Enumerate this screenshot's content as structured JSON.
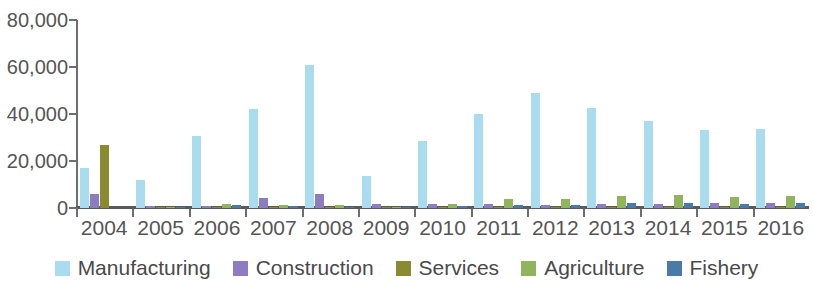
{
  "chart_data": {
    "type": "bar",
    "title": "",
    "subtitle": "",
    "xlabel": "",
    "ylabel": "",
    "ylim": [
      0,
      80000
    ],
    "grid": false,
    "legend_position": "bottom",
    "y_ticks": [
      "0",
      "20,000",
      "40,000",
      "60,000",
      "80,000"
    ],
    "y_tick_values": [
      0,
      20000,
      40000,
      60000,
      80000
    ],
    "categories": [
      "2004",
      "2005",
      "2006",
      "2007",
      "2008",
      "2009",
      "2010",
      "2011",
      "2012",
      "2013",
      "2014",
      "2015",
      "2016"
    ],
    "series": [
      {
        "name": "Manufacturing",
        "color": "#aadcf0",
        "values": [
          17000,
          11800,
          30800,
          42000,
          61000,
          13500,
          28500,
          40000,
          49000,
          42500,
          37000,
          33000,
          33500
        ]
      },
      {
        "name": "Construction",
        "color": "#8e7cc3",
        "values": [
          6000,
          900,
          800,
          4200,
          6000,
          1500,
          1600,
          1700,
          1300,
          1500,
          1900,
          2000,
          2000
        ]
      },
      {
        "name": "Services",
        "color": "#8a8a30",
        "values": [
          27000,
          400,
          300,
          300,
          300,
          300,
          300,
          300,
          300,
          300,
          300,
          300,
          300
        ]
      },
      {
        "name": "Agriculture",
        "color": "#8fb45c",
        "values": [
          0,
          600,
          1600,
          1100,
          1400,
          600,
          1800,
          3800,
          3700,
          5200,
          5400,
          4900,
          5000
        ]
      },
      {
        "name": "Fishery",
        "color": "#4a7aa8",
        "values": [
          0,
          200,
          1400,
          800,
          300,
          200,
          800,
          1100,
          1200,
          2000,
          2100,
          1900,
          2100
        ]
      }
    ]
  },
  "legend": {
    "items": [
      {
        "label": "Manufacturing",
        "color": "#aadcf0"
      },
      {
        "label": "Construction",
        "color": "#8e7cc3"
      },
      {
        "label": "Services",
        "color": "#8a8a30"
      },
      {
        "label": "Agriculture",
        "color": "#8fb45c"
      },
      {
        "label": "Fishery",
        "color": "#4a7aa8"
      }
    ]
  }
}
